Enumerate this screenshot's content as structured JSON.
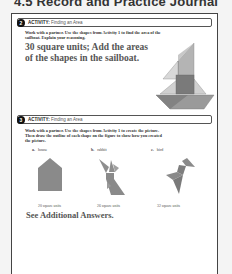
{
  "header": {
    "title": "4.5 Record and Practice Journal"
  },
  "activity2": {
    "number": "2",
    "label_bold": "ACTIVITY:",
    "label_text": " Finding an Area",
    "instructions_line1": "Work with a partner. Use the shapes from Activity 1 to find the area of the",
    "instructions_line2": "sailboat. Explain your reasoning.",
    "answer_line1": "30 square units; Add the areas",
    "answer_line2": "of the shapes in the sailboat.",
    "figure": "sailboat-tangram"
  },
  "activity3": {
    "number": "3",
    "label_bold": "ACTIVITY:",
    "label_text": " Finding an Area",
    "instructions_line1": "Work with a partner. Use the shapes from Activity 1 to create the picture.",
    "instructions_line2": "Then draw the outline of each shape on the figure to show how you created",
    "instructions_line3": "the picture.",
    "figures": [
      {
        "letter": "a.",
        "name": "house",
        "caption": "20 square units"
      },
      {
        "letter": "b.",
        "name": "rabbit",
        "caption": "26 square units"
      },
      {
        "letter": "c.",
        "name": "bird",
        "caption": "32 square units"
      }
    ],
    "additional": "See Additional Answers."
  },
  "colors": {
    "shape_dark": "#7a7a7a",
    "shape_mid": "#9a9a9a",
    "shape_light": "#c8c8c8"
  }
}
